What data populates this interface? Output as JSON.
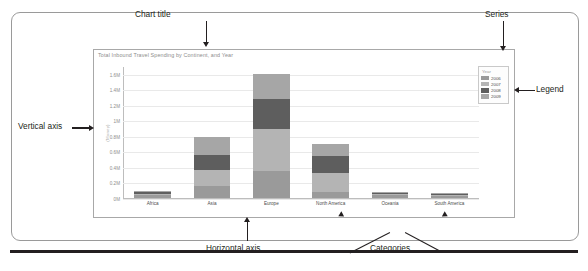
{
  "chart_data": {
    "type": "bar",
    "subtype": "stacked-column",
    "title": "Total Inbound Travel Spending by Continent, and Year",
    "xlabel": "",
    "ylabel": "(Money)",
    "categories": [
      "Africa",
      "Asia",
      "Europe",
      "North America",
      "Oceania",
      "South America"
    ],
    "series": [
      {
        "name": "2006",
        "color": "#9a9a9a",
        "values": [
          0.04,
          0.155,
          0.35,
          0.075,
          0.035,
          0.022
        ]
      },
      {
        "name": "2007",
        "color": "#b4b4b4",
        "values": [
          0.018,
          0.2,
          0.545,
          0.245,
          0.012,
          0.018
        ]
      },
      {
        "name": "2008",
        "color": "#5e5e5e",
        "values": [
          0.025,
          0.205,
          0.375,
          0.215,
          0.022,
          0.016
        ]
      },
      {
        "name": "2009",
        "color": "#a6a6a6",
        "values": [
          0.005,
          0.225,
          0.33,
          0.155,
          0.006,
          0.004
        ]
      }
    ],
    "ylim": [
      0,
      1.7
    ],
    "ytick_values": [
      0,
      0.2,
      0.4,
      0.6,
      0.8,
      1.0,
      1.2,
      1.4,
      1.6
    ],
    "ytick_labels": [
      "0M",
      "0.2M",
      "0.4M",
      "0.6M",
      "0.8M",
      "1M",
      "1.2M",
      "1.4M",
      "1.6M"
    ],
    "grid": true,
    "legend_position": "right",
    "legend_title": "Year"
  },
  "legend": {
    "title": "Year",
    "entries": [
      {
        "label": "2006",
        "color": "#9a9a9a"
      },
      {
        "label": "2007",
        "color": "#b4b4b4"
      },
      {
        "label": "2008",
        "color": "#5e5e5e"
      },
      {
        "label": "2009",
        "color": "#a6a6a6"
      }
    ]
  },
  "annotations": {
    "chart_title": "Chart title",
    "series": "Series",
    "legend": "Legend",
    "vertical_axis": "Vertical axis",
    "horizontal_axis": "Horizontal axis",
    "categories": "Categories"
  }
}
